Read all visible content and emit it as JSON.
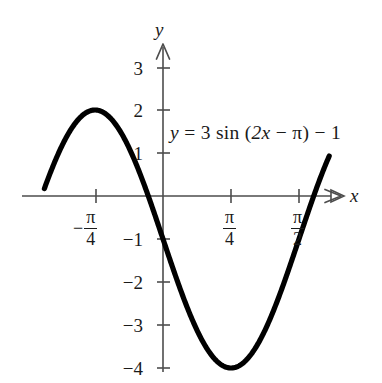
{
  "figure": {
    "background_color": "#ffffff",
    "curve_color": "#000000",
    "axis_color": "#4d4d4d",
    "text_color": "#1a1a1a",
    "equation_label": "y = 3 sin (2x − π) − 1",
    "equation_parts": {
      "lhs": "y",
      "equals": "=",
      "amplitude": "3",
      "function": "sin",
      "open_paren": "(",
      "inner_coefficient": "2x",
      "inner_minus": "−",
      "inner_shift": "π",
      "close_paren": ")",
      "outer_minus": "−",
      "vertical_shift": "1"
    },
    "axis_labels": {
      "x": "x",
      "y": "y"
    }
  },
  "chart_data": {
    "type": "line",
    "title": "",
    "subtitle": "",
    "xlabel": "x",
    "ylabel": "y",
    "equation": "y = 3 sin (2x − π) − 1",
    "amplitude": 3,
    "period": "π",
    "phase_shift": "π/2",
    "vertical_shift": -1,
    "grid": false,
    "legend": false,
    "legend_position": "none",
    "axis_arrows": {
      "x_positive": true,
      "y_positive": true
    },
    "xlim": [
      -1.37,
      1.92
    ],
    "ylim": [
      -4.5,
      3.5
    ],
    "xtick_values": [
      -0.7854,
      0.7854,
      1.5708
    ],
    "xtick_labels": [
      "-π/4",
      "π/4",
      "π/2"
    ],
    "xtick_label_parts": [
      {
        "sign": "−",
        "numerator": "π",
        "denominator": "4"
      },
      {
        "sign": "",
        "numerator": "π",
        "denominator": "4"
      },
      {
        "sign": "",
        "numerator": "π",
        "denominator": "2"
      }
    ],
    "ytick_values": [
      3,
      2,
      1,
      -1,
      -2,
      -3,
      -4
    ],
    "ytick_labels": [
      "3",
      "2",
      "1",
      "−1",
      "−2",
      "−3",
      "−4"
    ],
    "key_points": [
      {
        "label": "maximum",
        "x": -0.7854,
        "y": 2
      },
      {
        "label": "x-intercept-left",
        "x": -1.2955,
        "y": 0
      },
      {
        "label": "x-intercept-right",
        "x": -0.2753,
        "y": 0
      },
      {
        "label": "y-intercept",
        "x": 0,
        "y": -1
      },
      {
        "label": "minimum",
        "x": 0.7854,
        "y": -4
      },
      {
        "label": "midline-crossing",
        "x": 1.5708,
        "y": -1
      }
    ],
    "series": [
      {
        "name": "y = 3 sin (2x − π) − 1",
        "x": [
          -1.37,
          -1.3,
          -1.2,
          -1.1,
          -1.0,
          -0.9,
          -0.7854,
          -0.7,
          -0.6,
          -0.5,
          -0.4,
          -0.3,
          -0.2,
          -0.1,
          0.0,
          0.1,
          0.2,
          0.3,
          0.4,
          0.5,
          0.6,
          0.7,
          0.7854,
          0.9,
          1.0,
          1.1,
          1.2,
          1.3,
          1.4,
          1.5,
          1.6,
          1.7,
          1.78
        ],
        "y": [
          -0.38,
          0.16,
          0.86,
          1.41,
          1.8,
          1.98,
          2.0,
          1.96,
          1.77,
          1.42,
          0.94,
          0.36,
          -0.25,
          -0.86,
          -1.0,
          -2.0,
          -2.52,
          -2.97,
          -3.35,
          -3.65,
          -3.85,
          -3.97,
          -4.0,
          -3.91,
          -3.72,
          -3.45,
          -3.09,
          -2.67,
          -2.2,
          -1.7,
          -1.19,
          -0.69,
          -0.31
        ]
      }
    ]
  },
  "geometry": {
    "origin_x": 163,
    "origin_y": 196,
    "unit_y_px": 43,
    "unit_quarter_pi_px": 68
  }
}
